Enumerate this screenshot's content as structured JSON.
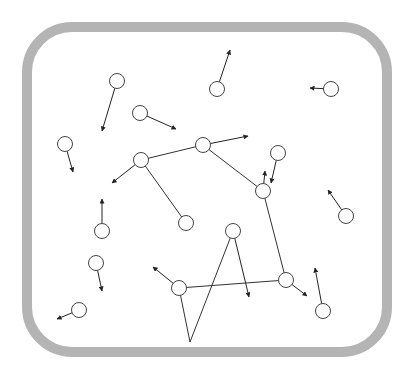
{
  "container": {
    "x": 27,
    "y": 27,
    "width": 360,
    "height": 325,
    "radius": 45,
    "stroke": "#b4b4b4",
    "stroke_width": 10
  },
  "style": {
    "particle_stroke": "#444444",
    "particle_fill": "#ffffff",
    "particle_radius": 7.5,
    "arrow_color": "#222222",
    "link_color": "#333333"
  },
  "particles": [
    {
      "id": "p1",
      "cx": 117,
      "cy": 81,
      "vx": 102,
      "vy": 131
    },
    {
      "id": "p2",
      "cx": 140,
      "cy": 113,
      "vx": 176,
      "vy": 129
    },
    {
      "id": "p3",
      "cx": 65,
      "cy": 144,
      "vx": 73,
      "vy": 172
    },
    {
      "id": "p4",
      "cx": 141,
      "cy": 160,
      "vx": 112,
      "vy": 183
    },
    {
      "id": "p5",
      "cx": 217,
      "cy": 89,
      "vx": 230,
      "vy": 50
    },
    {
      "id": "p6",
      "cx": 331,
      "cy": 89,
      "vx": 310,
      "vy": 88
    },
    {
      "id": "p7",
      "cx": 203,
      "cy": 145,
      "vx": 248,
      "vy": 136
    },
    {
      "id": "p8",
      "cx": 278,
      "cy": 153,
      "vx": 271,
      "vy": 183
    },
    {
      "id": "p9",
      "cx": 263,
      "cy": 191,
      "vx": 265,
      "vy": 171
    },
    {
      "id": "p10",
      "cx": 346,
      "cy": 216,
      "vx": 328,
      "vy": 190
    },
    {
      "id": "p11",
      "cx": 186,
      "cy": 223,
      "vx": null,
      "vy": null
    },
    {
      "id": "p12",
      "cx": 102,
      "cy": 231,
      "vx": 102,
      "vy": 199
    },
    {
      "id": "p13",
      "cx": 233,
      "cy": 231,
      "vx": 249,
      "vy": 297
    },
    {
      "id": "p14",
      "cx": 96,
      "cy": 263,
      "vx": 102,
      "vy": 291
    },
    {
      "id": "p15",
      "cx": 179,
      "cy": 288,
      "vx": 153,
      "vy": 267
    },
    {
      "id": "p16",
      "cx": 286,
      "cy": 280,
      "vx": 307,
      "vy": 296
    },
    {
      "id": "p17",
      "cx": 323,
      "cy": 311,
      "vx": 315,
      "vy": 268
    },
    {
      "id": "p18",
      "cx": 79,
      "cy": 310,
      "vx": 57,
      "vy": 319
    }
  ],
  "links": [
    {
      "from": "p4",
      "to": "p7"
    },
    {
      "from": "p4",
      "to": "p11"
    },
    {
      "from": "p7",
      "to": "p9"
    },
    {
      "from": "p9",
      "to": "p16"
    },
    {
      "from": "p15",
      "to": "p16"
    },
    {
      "from": "p15",
      "to": "vertex"
    },
    {
      "from": "p13",
      "to": "vertex"
    }
  ],
  "vertex": {
    "x": 190,
    "y": 342
  }
}
